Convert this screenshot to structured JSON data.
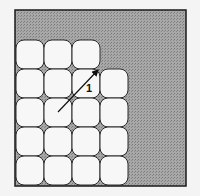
{
  "diagram": {
    "colors": {
      "background": "#f4f4f4",
      "shaded_region": "#9a9a9a",
      "tile_fill": "#f7f7f7",
      "tile_stroke": "#2a2a2a",
      "frame_stroke": "#1a1a1a"
    },
    "grid": {
      "rows": [
        {
          "cells": 3
        },
        {
          "cells": 4
        },
        {
          "cells": 4
        },
        {
          "cells": 4
        },
        {
          "cells": 4
        }
      ]
    },
    "arrow": {
      "label": "1"
    }
  }
}
